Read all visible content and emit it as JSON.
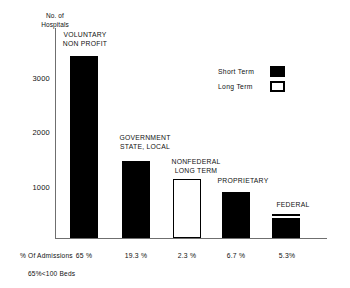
{
  "chart_data": {
    "type": "bar",
    "title": "",
    "xlabel": "",
    "ylabel": "No. of\nHospitals",
    "ylim": [
      0,
      3900
    ],
    "yticks": [
      1000,
      2000,
      3000
    ],
    "ytick_labels": [
      "1000",
      "2000",
      "3000"
    ],
    "grid": false,
    "legend_position": "upper-right",
    "categories": [
      "VOLUNTARY\nNON PROFIT",
      "GOVERNMENT\nSTATE, LOCAL",
      "NONFEDERAL\nLONG TERM",
      "PROPRIETARY",
      "FEDERAL"
    ],
    "series": [
      {
        "name": "Short Term",
        "color": "#000000",
        "values": [
          3420,
          1430,
          0,
          860,
          380
        ]
      },
      {
        "name": "Long Term",
        "color": "#ffffff",
        "values": [
          0,
          0,
          1090,
          0,
          60
        ]
      }
    ],
    "totals": [
      3420,
      1430,
      1090,
      860,
      440
    ],
    "annotations": {
      "admissions_row_label": "% Of Admissions",
      "admissions_values": [
        "65 %",
        "19.3 %",
        "2.3 %",
        "6.7 %",
        "5.3%"
      ],
      "footnote": "65%<100 Beds"
    }
  },
  "axis": {
    "y_title": "No. of\nHospitals",
    "y_ticks": [
      {
        "label": "3000",
        "top": 74
      },
      {
        "label": "2000",
        "top": 128
      },
      {
        "label": "1000",
        "top": 183
      }
    ]
  },
  "legend": {
    "rows": [
      {
        "label": "Short  Term",
        "style": "filled"
      },
      {
        "label": "Long  Term",
        "style": "hollow"
      }
    ]
  },
  "bars": [
    {
      "key": "voluntary-non-profit",
      "label": "VOLUNTARY\nNON PROFIT",
      "label_left": 54,
      "label_top": 31,
      "label_width": 62,
      "left": 70,
      "width": 28,
      "top": 56,
      "height": 182,
      "fill": "short",
      "long_band": null,
      "admissions": "65 %",
      "admissions_left": 64,
      "admissions_width": 40
    },
    {
      "key": "government-state-local",
      "label": "GOVERNMENT\nSTATE, LOCAL",
      "label_left": 111,
      "label_top": 134,
      "label_width": 68,
      "left": 122,
      "width": 28,
      "top": 161,
      "height": 77,
      "fill": "short",
      "long_band": null,
      "admissions": "19.3 %",
      "admissions_left": 116,
      "admissions_width": 40
    },
    {
      "key": "nonfederal-long-term",
      "label": "NONFEDERAL\nLONG TERM",
      "label_left": 163,
      "label_top": 158,
      "label_width": 66,
      "left": 173,
      "width": 28,
      "top": 179,
      "height": 59,
      "fill": "long",
      "long_band": null,
      "admissions": "2.3 %",
      "admissions_left": 167,
      "admissions_width": 40
    },
    {
      "key": "proprietary",
      "label": "PROPRIETARY",
      "label_left": 212,
      "label_top": 177,
      "label_width": 62,
      "left": 222,
      "width": 28,
      "top": 192,
      "height": 46,
      "fill": "short",
      "long_band": null,
      "admissions": "6.7 %",
      "admissions_left": 216,
      "admissions_width": 40
    },
    {
      "key": "federal",
      "label": "FEDERAL",
      "label_left": 265,
      "label_top": 201,
      "label_width": 56,
      "left": 272,
      "width": 28,
      "top": 214,
      "height": 24,
      "fill": "short",
      "long_band": {
        "top": 1,
        "height": 4
      },
      "admissions": "5.3%",
      "admissions_left": 267,
      "admissions_width": 40
    }
  ]
}
